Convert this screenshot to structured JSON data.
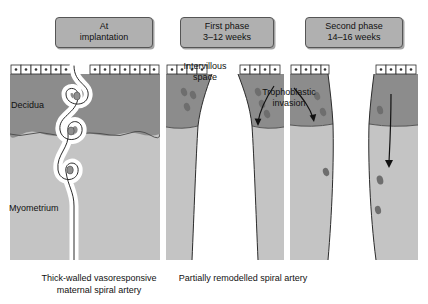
{
  "figure": {
    "colors": {
      "decidua": "#8c8c8c",
      "myometrium": "#c4c4c4",
      "vessel_lumen": "#ffffff",
      "trophoblast_cell": "#6e6e6e",
      "outline": "#2b2b2b",
      "title_box_fill": "#b0b0b0",
      "title_box_border": "#555555",
      "epithelium_fill": "#ffffff",
      "epithelium_nucleus": "#333333",
      "background": "#ffffff"
    }
  },
  "panels": [
    {
      "id": "panel-at-implantation",
      "title_line1": "At",
      "title_line2": "implantation",
      "caption_line1": "Thick-walled vasoresponsive",
      "caption_line2": "maternal spiral artery",
      "tissue_labels": {
        "decidua": "Decidua",
        "myometrium": "Myometrium"
      },
      "vessel_description": "coiled spiral artery with three loops",
      "trophoblast_cell_count": 3,
      "arrows": []
    },
    {
      "id": "panel-first-phase",
      "title_line1": "First phase",
      "title_line2": "3–12 weeks",
      "caption_line1": "Partially remodelled spiral artery",
      "caption_line2": "",
      "annotations": {
        "intervillous_line1": "Intervillous",
        "intervillous_line2": "space",
        "trophoblastic_line1": "Trophoblastic",
        "trophoblastic_line2": "invasion"
      },
      "vessel_description": "funnel-shaped dilated mouth narrowing in myometrium",
      "trophoblast_cell_count": 7,
      "arrows": [
        "trophoblastic-invasion-arrow"
      ]
    },
    {
      "id": "panel-second-phase",
      "title_line1": "Second phase",
      "title_line2": "14–16 weeks",
      "caption_line1": "",
      "caption_line2": "",
      "vessel_description": "widely dilated vessel, invasion extending into myometrium",
      "trophoblast_cell_count": 6,
      "arrows": [
        "deep-invasion-arrow"
      ]
    }
  ]
}
